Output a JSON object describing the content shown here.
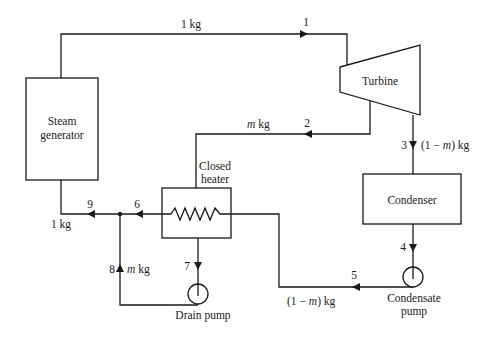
{
  "diagram": {
    "type": "regenerative-rankine-cycle-closed-feedwater-heater",
    "components": {
      "steam_generator": {
        "label_line1": "Steam",
        "label_line2": "generator"
      },
      "turbine": {
        "label": "Turbine"
      },
      "condenser": {
        "label": "Condenser"
      },
      "closed_heater": {
        "label_line1": "Closed",
        "label_line2": "heater"
      },
      "condensate_pump": {
        "label_line1": "Condensate",
        "label_line2": "pump"
      },
      "drain_pump": {
        "label": "Drain pump"
      }
    },
    "states": {
      "s1": "1",
      "s2": "2",
      "s3": "3",
      "s4": "4",
      "s5": "5",
      "s6": "6",
      "s7": "7",
      "s8": "8",
      "s9": "9"
    },
    "flows": {
      "top_1kg": "1 kg",
      "bleed_m": "m",
      "bleed_kg": " kg",
      "s3_prefix": "(1 − ",
      "s3_m": "m",
      "s3_suffix": ") kg",
      "s5_prefix": "(1 − ",
      "s5_m": "m",
      "s5_suffix": ") kg",
      "s8_m": "m",
      "s8_kg": " kg",
      "s9_1kg": "1 kg"
    },
    "colors": {
      "line": "#1a1a1a",
      "background": "#ffffff"
    }
  }
}
